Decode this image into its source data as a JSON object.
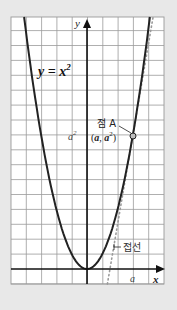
{
  "colors": {
    "background": "#e8e8e8",
    "grid_bg": "#ffffff",
    "grid_line": "#9a9a9a",
    "axis": "#111111",
    "curve": "#222222",
    "tangent": "#9a9a9a",
    "point_fill": "#bdbdbd"
  },
  "grid": {
    "left": 11,
    "top": 17,
    "right": 164,
    "bottom": 284,
    "origin_x": 87,
    "origin_y": 269,
    "unit_x": 15.3,
    "unit_y": 14.9,
    "cols": 10
  },
  "labels": {
    "y_axis": "y",
    "x_axis": "x",
    "curve": "y = x",
    "curve_exp": "2",
    "point_name": "점 A",
    "a_squared": "a",
    "a_squared_exp": "2",
    "point_coord_open": "(",
    "point_coord_a": "a",
    "point_coord_sep": ", ",
    "point_coord_a2": "a",
    "point_coord_exp": "2",
    "point_coord_close": ")",
    "tangent": "접선",
    "a_tick": "a"
  },
  "chart_data": {
    "type": "line",
    "title": "",
    "function": "y = x^2",
    "xlabel": "x",
    "ylabel": "y",
    "grid": true,
    "xlim": [
      -5,
      5
    ],
    "ylim": [
      -1,
      17
    ],
    "series": [
      {
        "name": "y = x²",
        "style": "solid",
        "x": [
          -4.1,
          -3,
          -2,
          -1,
          0,
          1,
          2,
          3,
          4.1
        ],
        "y": [
          16.81,
          9,
          4,
          1,
          0,
          1,
          4,
          9,
          16.81
        ]
      },
      {
        "name": "접선",
        "style": "dotted",
        "x": [
          1.33,
          1.5,
          3,
          4.32
        ],
        "y": [
          -1,
          0,
          9,
          16.9
        ]
      }
    ],
    "annotations": [
      {
        "text": "점 A",
        "point": [
          "a",
          "a²"
        ],
        "a": 3
      },
      {
        "text": "a²",
        "on": "y-level of A"
      },
      {
        "text": "a",
        "on": "x-axis"
      },
      {
        "text": "접선",
        "target": "tangent line"
      }
    ]
  }
}
